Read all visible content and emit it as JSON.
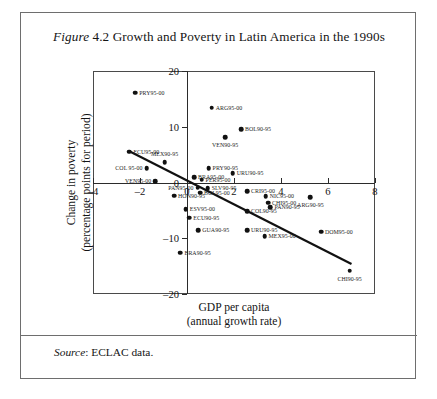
{
  "figure": {
    "label_italic": "Figure",
    "number": "4.2",
    "title": "Growth and Poverty in Latin America in the 1990s",
    "source_italic": "Source",
    "source_text": ": ECLAC data."
  },
  "chart_data": {
    "type": "scatter",
    "title": "Growth and Poverty in Latin America in the 1990s",
    "xlabel": "GDP per capita (annual growth rate)",
    "xlabel_line1": "GDP per capita",
    "xlabel_line2": "(annual growth rate)",
    "ylabel": "Change in poverty (percentage points for period)",
    "ylabel_line1": "Change in poverty",
    "ylabel_line2": "(percentage points for period)",
    "xlim": [
      -4,
      8
    ],
    "ylim": [
      -20,
      20
    ],
    "xticks": [
      -4,
      -2,
      0,
      2,
      4,
      6,
      8
    ],
    "xticklabels": [
      "–4",
      "–2",
      "0",
      "2",
      "4",
      "6",
      "8"
    ],
    "yticks": [
      -20,
      -10,
      0,
      10,
      20
    ],
    "yticklabels": [
      "–20",
      "–10",
      "0",
      "10",
      "20"
    ],
    "grid": false,
    "legend": "none",
    "marker_color": "#111111",
    "trendline": {
      "x0": -2.45,
      "y0": 5.6,
      "x1": 7.0,
      "y1": -14.6,
      "color": "#111111"
    },
    "points": [
      {
        "label": "PRY95-00",
        "x": -2.2,
        "y": 16.1,
        "lpos": "right"
      },
      {
        "label": "ARG95-00",
        "x": 1.05,
        "y": 13.4,
        "lpos": "right"
      },
      {
        "label": "BOL90-95",
        "x": 2.3,
        "y": 9.6,
        "lpos": "right"
      },
      {
        "label": "VEN90-95",
        "x": 1.62,
        "y": 8.1,
        "lpos": "below"
      },
      {
        "label": "ECU95-00",
        "x": -2.45,
        "y": 5.5,
        "lpos": "right"
      },
      {
        "label": "MEX90-95",
        "x": -0.95,
        "y": 3.6,
        "lpos": "above"
      },
      {
        "label": "COL 95-00",
        "x": -1.72,
        "y": 2.6,
        "lpos": "left"
      },
      {
        "label": "PRY90-95",
        "x": 0.92,
        "y": 2.6,
        "lpos": "right"
      },
      {
        "label": "URU90-95",
        "x": 1.95,
        "y": 1.7,
        "lpos": "right"
      },
      {
        "label": "BRA95-00",
        "x": 0.3,
        "y": 0.9,
        "lpos": "right"
      },
      {
        "label": "PER95-00",
        "x": 0.62,
        "y": 0.5,
        "lpos": "right"
      },
      {
        "label": "VEN95-00",
        "x": -1.35,
        "y": 0.2,
        "lpos": "left"
      },
      {
        "label": "PAN95-00",
        "x": 0.45,
        "y": -0.9,
        "lpos": "left"
      },
      {
        "label": "SLV90-95",
        "x": 0.88,
        "y": -1.0,
        "lpos": "right"
      },
      {
        "label": "BOL95-00",
        "x": 0.55,
        "y": -1.8,
        "lpos": "right"
      },
      {
        "label": "CRI95-00",
        "x": 2.55,
        "y": -1.6,
        "lpos": "right"
      },
      {
        "label": "HON90-95",
        "x": -0.55,
        "y": -2.4,
        "lpos": "right"
      },
      {
        "label": "NIC95-00",
        "x": 3.35,
        "y": -2.5,
        "lpos": "right"
      },
      {
        "label": "CHI95-00",
        "x": 3.45,
        "y": -3.6,
        "lpos": "right"
      },
      {
        "label": "PAN90-95",
        "x": 3.55,
        "y": -4.4,
        "lpos": "right"
      },
      {
        "label": "ESV95-00",
        "x": -0.05,
        "y": -4.8,
        "lpos": "right"
      },
      {
        "label": "COL90-95",
        "x": 2.55,
        "y": -5.2,
        "lpos": "right"
      },
      {
        "label": "ECU90-95",
        "x": 0.1,
        "y": -6.3,
        "lpos": "right"
      },
      {
        "label": "ARG90-95",
        "x": 5.25,
        "y": -2.6,
        "lpos": "below"
      },
      {
        "label": "GUA90-95",
        "x": 0.48,
        "y": -8.6,
        "lpos": "right"
      },
      {
        "label": "URU90-95b",
        "x": 2.55,
        "y": -8.6,
        "lpos": "right"
      },
      {
        "label": "MEX95-00",
        "x": 3.3,
        "y": -9.6,
        "lpos": "right"
      },
      {
        "label": "DOM95-00",
        "x": 5.7,
        "y": -8.8,
        "lpos": "right"
      },
      {
        "label": "BRA90-95",
        "x": -0.28,
        "y": -12.6,
        "lpos": "right"
      },
      {
        "label": "CHI90-95",
        "x": 6.92,
        "y": -15.8,
        "lpos": "below"
      }
    ]
  }
}
